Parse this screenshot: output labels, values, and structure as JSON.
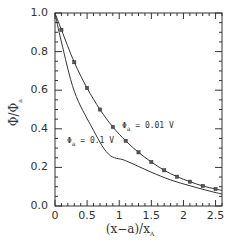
{
  "chart_data": {
    "type": "line",
    "title": "",
    "xlabel": "(x−a)/x_A",
    "ylabel": "Φ/Φ_a",
    "xlim": [
      0,
      2.6
    ],
    "ylim": [
      0,
      1.0
    ],
    "x_ticks": [
      0,
      0.5,
      1,
      1.5,
      2,
      2.5
    ],
    "x_tick_labels": [
      "0",
      "0.5",
      "1",
      "1.5",
      "2",
      "2.5"
    ],
    "y_ticks": [
      0,
      0.2,
      0.4,
      0.6,
      0.8,
      1.0
    ],
    "y_tick_labels": [
      "0.0",
      "0.2",
      "0.4",
      "0.6",
      "0.8",
      "1.0"
    ],
    "grid": false,
    "legend": "inline annotations",
    "series": [
      {
        "name": "Φa = 0.01 V",
        "style": "line with square markers",
        "line_x": [
          0,
          0.1,
          0.3,
          0.5,
          0.7,
          0.9,
          1.1,
          1.3,
          1.5,
          1.7,
          1.9,
          2.1,
          2.3,
          2.5,
          2.6
        ],
        "line_y": [
          1.0,
          0.913,
          0.745,
          0.611,
          0.5,
          0.41,
          0.338,
          0.278,
          0.228,
          0.185,
          0.152,
          0.126,
          0.104,
          0.088,
          0.081
        ],
        "markers_x": [
          0.1,
          0.3,
          0.5,
          0.7,
          0.9,
          1.1,
          1.3,
          1.5,
          1.7,
          1.9,
          2.1,
          2.3,
          2.5
        ],
        "markers_y": [
          0.913,
          0.745,
          0.611,
          0.5,
          0.41,
          0.338,
          0.278,
          0.228,
          0.185,
          0.152,
          0.126,
          0.104,
          0.088
        ]
      },
      {
        "name": "Φa = 0.1 V",
        "style": "line",
        "line_x": [
          0,
          0.1,
          0.3,
          0.57,
          0.83,
          1.1,
          1.48,
          1.8,
          2.1,
          2.4,
          2.6
        ],
        "line_y": [
          1.0,
          0.85,
          0.595,
          0.41,
          0.27,
          0.235,
          0.178,
          0.135,
          0.105,
          0.078,
          0.062
        ]
      }
    ],
    "annotations": [
      {
        "text": "Φa = 0.01 V",
        "x": 1.05,
        "y": 0.41
      },
      {
        "text": "Φa = 0.1 V",
        "x": 0.22,
        "y": 0.33
      }
    ]
  },
  "axes": {
    "x_title_main": "(x−a)/x",
    "x_title_sub": "A",
    "y_title_main": "Φ/Φ",
    "y_title_sub": "a"
  },
  "labels": {
    "upper_main": "Φ",
    "upper_sub": "a",
    "upper_value": " = 0.01 V",
    "lower_main": "Φ",
    "lower_sub": "a",
    "lower_value": " = 0.1 V"
  }
}
